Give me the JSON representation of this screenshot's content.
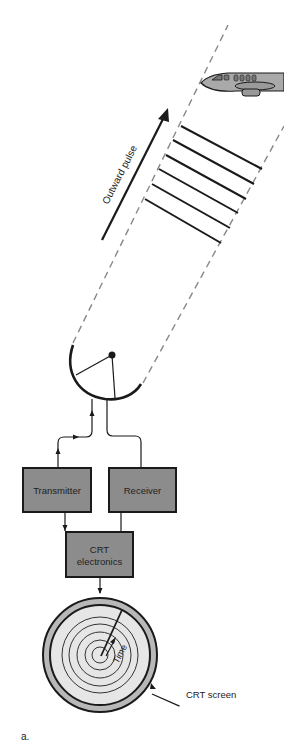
{
  "diagram": {
    "labels": {
      "outward_pulse": "Outward pulse",
      "transmitter": "Transmitter",
      "receiver": "Receiver",
      "crt_line1": "CRT",
      "crt_line2": "electronics",
      "time": "Time",
      "crt_screen": "CRT screen",
      "panel": "a."
    },
    "colors": {
      "box_fill": "#8c8c8c",
      "box_stroke": "#1a1a1a",
      "screen_fill": "#e6e6e6",
      "screen_rim": "#b8b8b8",
      "plane_fill": "#a9a9a9",
      "dash": "#888888",
      "line": "#1a1a1a"
    },
    "pulse_wavefront_count": 6
  }
}
